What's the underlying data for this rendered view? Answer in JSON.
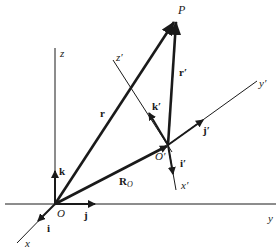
{
  "diagram": {
    "type": "vector-coordinate-frames",
    "colors": {
      "line": "#1a1a1a",
      "background": "#ffffff"
    },
    "fixed_frame": {
      "origin_label": "O",
      "axes": {
        "x": "x",
        "y": "y",
        "z": "z"
      },
      "unit_vectors": {
        "i": "i",
        "j": "j",
        "k": "k"
      }
    },
    "moving_frame": {
      "origin_label": "O′",
      "axes": {
        "x": "x′",
        "y": "y′",
        "z": "z′"
      },
      "unit_vectors": {
        "i": "i′",
        "j": "j′",
        "k": "k′"
      }
    },
    "point_label": "P",
    "vectors": {
      "r": "r",
      "r_prime": "r′",
      "R_O": "R",
      "R_O_sub": "O"
    }
  }
}
